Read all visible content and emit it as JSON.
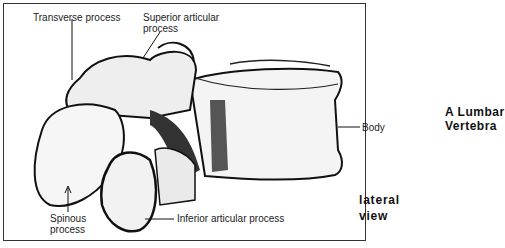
{
  "figure": {
    "title_line1": "A Lumbar",
    "title_line2": "Vertebra",
    "view_line1": "lateral",
    "view_line2": "view"
  },
  "labels": {
    "transverse_process": "Transverse process",
    "superior_articular_line1": "Superior articular",
    "superior_articular_line2": "process",
    "body": "Body",
    "spinous_line1": "Spinous",
    "spinous_line2": "process",
    "inferior_articular": "Inferior articular process"
  }
}
